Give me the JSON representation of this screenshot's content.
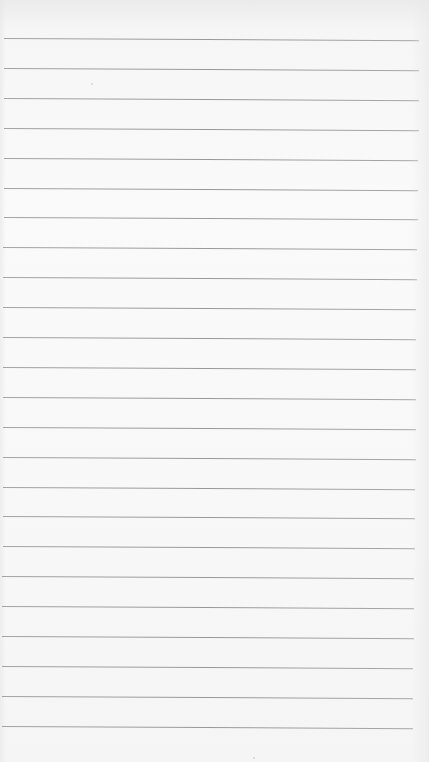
{
  "page": {
    "type": "lined-paper",
    "background_color": "#f7f7f7",
    "rule_color": "#939393",
    "rule_count": 24,
    "first_rule_y": 38,
    "rule_spacing": 29.9,
    "rule_left": 4,
    "rule_right_top": 419,
    "rule_right_bottom": 413,
    "content_text": ""
  }
}
